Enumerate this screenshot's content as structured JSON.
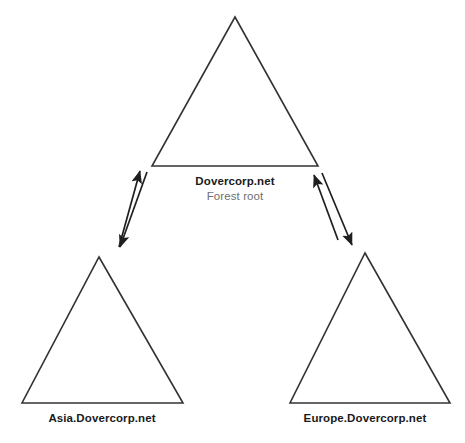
{
  "diagram": {
    "type": "active-directory-forest-trust",
    "background_color": "#ffffff",
    "line_color": "#333333",
    "primary_text_color": "#1a1a1a",
    "secondary_text_color": "#6f6f6f",
    "nodes": [
      {
        "id": "root",
        "shape": "triangle",
        "primary_label": "Dovercorp.net",
        "secondary_label": "Forest root",
        "apex": {
          "x": 235,
          "y": 17
        },
        "base_left": {
          "x": 152,
          "y": 166
        },
        "base_right": {
          "x": 318,
          "y": 166
        }
      },
      {
        "id": "asia",
        "shape": "triangle",
        "primary_label": "Asia.Dovercorp.net",
        "secondary_label": "",
        "apex": {
          "x": 99,
          "y": 257
        },
        "base_left": {
          "x": 22,
          "y": 403
        },
        "base_right": {
          "x": 183,
          "y": 403
        }
      },
      {
        "id": "europe",
        "shape": "triangle",
        "primary_label": "Europe.Dovercorp.net",
        "secondary_label": "",
        "apex": {
          "x": 365,
          "y": 253
        },
        "base_left": {
          "x": 290,
          "y": 403
        },
        "base_right": {
          "x": 450,
          "y": 403
        }
      }
    ],
    "connectors": [
      {
        "id": "root-to-asia",
        "from": "root",
        "to": "asia",
        "direction": "bidirectional",
        "style": "two-parallel-single-headed-arrows"
      },
      {
        "id": "root-to-europe",
        "from": "root",
        "to": "europe",
        "direction": "bidirectional",
        "style": "two-parallel-single-headed-arrows"
      }
    ]
  }
}
